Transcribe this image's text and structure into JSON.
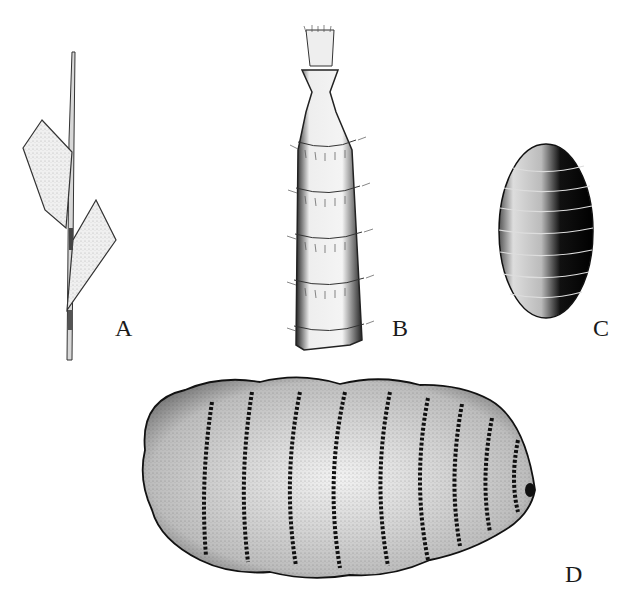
{
  "figure": {
    "background": "#ffffff",
    "ink_color": "#1a1a1a",
    "panels": [
      {
        "id": "A",
        "label": "A",
        "subject": "grass stem with leaf blades"
      },
      {
        "id": "B",
        "label": "B",
        "subject": "banded hairy cylindrical structure"
      },
      {
        "id": "C",
        "label": "C",
        "subject": "small segmented oval pupa"
      },
      {
        "id": "D",
        "label": "D",
        "subject": "segmented larva with rows of hooks"
      }
    ]
  }
}
